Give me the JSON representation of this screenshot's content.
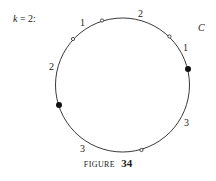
{
  "diagram": {
    "header_label": "k = 2:",
    "curve_label": "C",
    "circle": {
      "cx": 122.5,
      "cy": 85,
      "r": 67,
      "stroke": "#222222"
    },
    "open_points": [
      {
        "x": 102,
        "y": 20.5
      },
      {
        "x": 73,
        "y": 39
      },
      {
        "x": 169.5,
        "y": 36.5
      },
      {
        "x": 141.5,
        "y": 150
      }
    ],
    "filled_points": [
      {
        "x": 188,
        "y": 69
      },
      {
        "x": 59,
        "y": 105
      }
    ],
    "arc_labels": [
      {
        "text": "1",
        "x": 80,
        "y": 26
      },
      {
        "text": "2",
        "x": 141,
        "y": 17
      },
      {
        "text": "1",
        "x": 186,
        "y": 51
      },
      {
        "text": "2",
        "x": 52,
        "y": 70
      },
      {
        "text": "3",
        "x": 187,
        "y": 126
      },
      {
        "text": "3",
        "x": 83,
        "y": 152
      }
    ]
  },
  "caption": {
    "prefix": "FIGURE",
    "number": "34"
  }
}
